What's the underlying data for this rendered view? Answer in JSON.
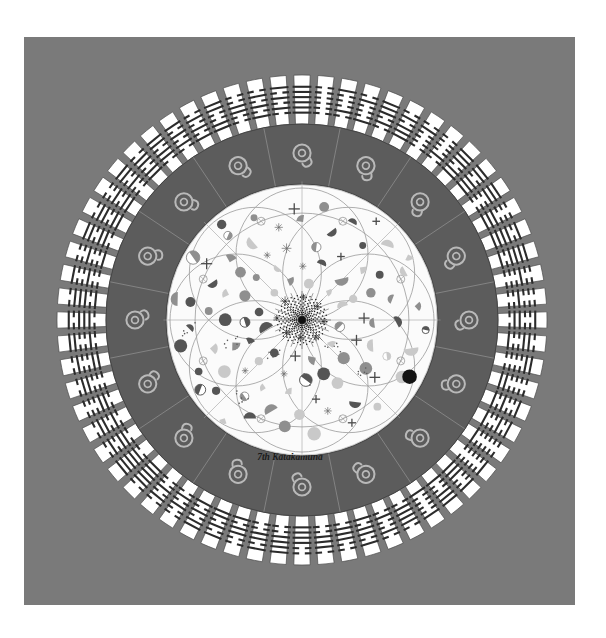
{
  "meta": {
    "title": "7th Katakamuna Mandala",
    "caption": "7th Katakamuna",
    "width": 606,
    "height": 638
  },
  "canvas": {
    "page_background": "#ffffff",
    "panel_background": "#7a7a7a",
    "panel": {
      "x": 24,
      "y": 37,
      "w": 551,
      "h": 568
    }
  },
  "mandala": {
    "center_x": 302,
    "center_y": 320,
    "outer_radius": 245,
    "ring_outer_inner_radius": 196,
    "dark_ring_outer_radius": 196,
    "dark_ring_inner_radius": 136,
    "inner_disc_radius": 136,
    "colors": {
      "ring_fill": "#ffffff",
      "ring_stroke": "#4a4a4a",
      "dark_ring_fill": "#5c5c5c",
      "dark_ring_stroke": "#3c3c3c",
      "glyph_color": "#b9b9b9",
      "inner_fill": "#fbfbfb",
      "lattice_stroke": "#9a9a9a",
      "dot_dark": "#555555",
      "dot_mid": "#8f8f8f",
      "dot_light": "#c9c9c9",
      "dot_black": "#141414",
      "hexagram_line": "#2b2b2b",
      "caption_color": "#1a1a1a"
    },
    "outer_ring": {
      "segment_count": 64,
      "description": "I Ching hexagrams, six stacked lines per segment",
      "line_rows": 6
    },
    "dark_ring": {
      "segment_count": 16,
      "glyph_name": "katakamuna-glyph",
      "glyph_description": "circle with inner ring and curved tail"
    },
    "inner_disc": {
      "lattice_circle_count": 8,
      "lattice_radius": 66,
      "node_symbols": [
        "filled-circle",
        "half-circle",
        "quarter-circle",
        "plus-mark",
        "star-mark"
      ]
    }
  },
  "chart_data": {
    "type": "pie",
    "title": "7th Katakamuna",
    "categories": [
      "seg-01",
      "seg-02",
      "seg-03",
      "seg-04",
      "seg-05",
      "seg-06",
      "seg-07",
      "seg-08",
      "seg-09",
      "seg-10",
      "seg-11",
      "seg-12",
      "seg-13",
      "seg-14",
      "seg-15",
      "seg-16",
      "seg-17",
      "seg-18",
      "seg-19",
      "seg-20",
      "seg-21",
      "seg-22",
      "seg-23",
      "seg-24",
      "seg-25",
      "seg-26",
      "seg-27",
      "seg-28",
      "seg-29",
      "seg-30",
      "seg-31",
      "seg-32",
      "seg-33",
      "seg-34",
      "seg-35",
      "seg-36",
      "seg-37",
      "seg-38",
      "seg-39",
      "seg-40",
      "seg-41",
      "seg-42",
      "seg-43",
      "seg-44",
      "seg-45",
      "seg-46",
      "seg-47",
      "seg-48",
      "seg-49",
      "seg-50",
      "seg-51",
      "seg-52",
      "seg-53",
      "seg-54",
      "seg-55",
      "seg-56",
      "seg-57",
      "seg-58",
      "seg-59",
      "seg-60",
      "seg-61",
      "seg-62",
      "seg-63",
      "seg-64"
    ],
    "values": [
      1,
      1,
      1,
      1,
      1,
      1,
      1,
      1,
      1,
      1,
      1,
      1,
      1,
      1,
      1,
      1,
      1,
      1,
      1,
      1,
      1,
      1,
      1,
      1,
      1,
      1,
      1,
      1,
      1,
      1,
      1,
      1,
      1,
      1,
      1,
      1,
      1,
      1,
      1,
      1,
      1,
      1,
      1,
      1,
      1,
      1,
      1,
      1,
      1,
      1,
      1,
      1,
      1,
      1,
      1,
      1,
      1,
      1,
      1,
      1,
      1,
      1,
      1,
      1
    ],
    "hexagram_codes": [
      "111111",
      "000000",
      "100010",
      "010001",
      "111010",
      "010111",
      "010000",
      "000010",
      "111011",
      "110111",
      "111000",
      "000111",
      "101111",
      "111101",
      "001000",
      "000100",
      "100110",
      "011001",
      "110000",
      "000011",
      "100101",
      "101001",
      "000001",
      "100000",
      "100111",
      "111001",
      "100001",
      "011110",
      "010010",
      "101101",
      "001110",
      "011100",
      "001111",
      "111100",
      "101100",
      "001101",
      "101011",
      "110101",
      "001010",
      "010100",
      "011111",
      "111110",
      "010110",
      "011010",
      "000110",
      "011000",
      "010011",
      "110010",
      "101110",
      "011101",
      "100100",
      "001001",
      "110110",
      "011011",
      "001011",
      "110100",
      "011011",
      "110110",
      "101010",
      "010101",
      "110011",
      "001100",
      "010101",
      "101010"
    ],
    "legend": [],
    "xlabel": "",
    "ylabel": "",
    "grid": false
  }
}
